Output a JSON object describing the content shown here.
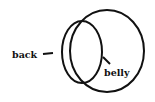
{
  "diagram": {
    "type": "labeled-outline",
    "shapes": [
      {
        "name": "outer-circle",
        "cx": 107,
        "cy": 51,
        "rx": 37,
        "ry": 41
      },
      {
        "name": "inner-oval",
        "cx": 82,
        "cy": 52,
        "rx": 20,
        "ry": 31
      }
    ],
    "labels": {
      "back": "back",
      "belly": "belly"
    },
    "stroke_color": "#111111",
    "background": "#ffffff"
  }
}
